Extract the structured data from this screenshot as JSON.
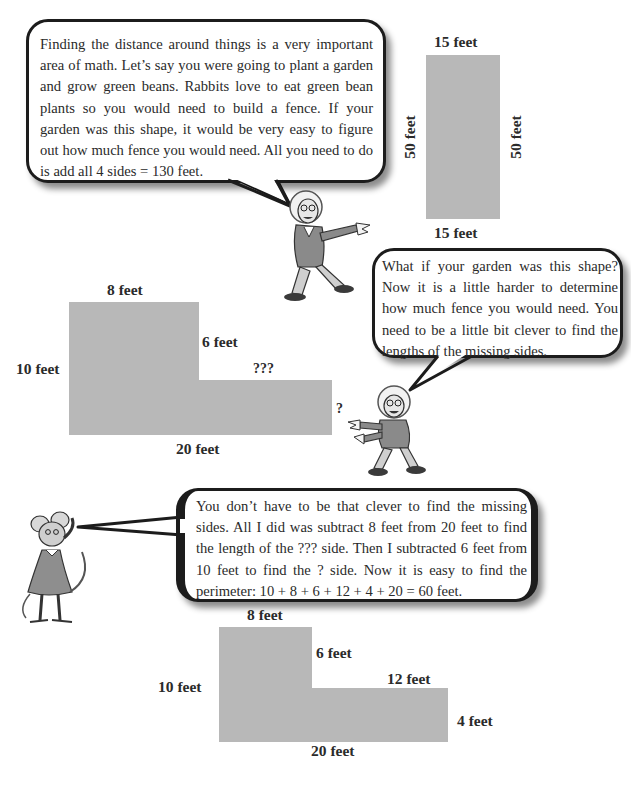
{
  "bubbles": {
    "intro": "Finding the distance around things is a very important area of math. Let’s say you were going to plant a garden and grow green beans. Rabbits love to eat green bean plants so you would need to build a fence. If your garden was this shape, it would be very easy to figure out how much fence you would need. All you need to do is add all 4 sides = 130 feet.",
    "question": "What if your garden was this shape? Now it is a little harder to determine how much fence you would need. You need to be a little bit clever to find the lengths of the missing sides.",
    "answer": "You don’t have to be that clever to find the missing sides. All I did was subtract 8 feet from 20 feet to find the length of the ??? side. Then I subtracted 6 feet from 10 feet to find the ? side. Now it is easy to find the perimeter: 10 + 8 + 6 + 12 + 4 + 20 = 60 feet."
  },
  "rectangle": {
    "top": "15 feet",
    "bottom": "15 feet",
    "left": "50 feet",
    "right": "50 feet"
  },
  "l_shape_unknown": {
    "top": "8 feet",
    "inner_vertical": "6 feet",
    "left": "10 feet",
    "inner_horizontal": "???",
    "right": "?",
    "bottom": "20 feet"
  },
  "l_shape_solved": {
    "top": "8 feet",
    "inner_vertical": "6 feet",
    "left": "10 feet",
    "inner_horizontal": "12 feet",
    "right": "4 feet",
    "bottom": "20 feet"
  },
  "characters": {
    "professor_pointing": "professor-pointing-right",
    "professor_crouching": "professor-pointing-left",
    "mouse": "mouse-girl-thinking"
  },
  "colors": {
    "shape_fill": "#b8b8b8",
    "bubble_border": "#1c1c1c"
  }
}
